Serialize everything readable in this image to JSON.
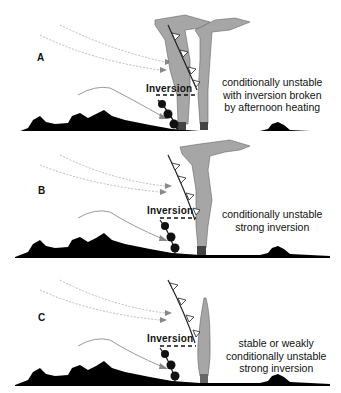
{
  "figure": {
    "panels": [
      {
        "letter": "A",
        "inversion_label": "Inversion",
        "caption_lines": [
          "conditionally unstable",
          "with inversion broken",
          "by afternoon heating"
        ],
        "plume": "two tall leaning plumes breaking through inversion"
      },
      {
        "letter": "B",
        "inversion_label": "Inversion",
        "caption_lines": [
          "conditionally unstable",
          "strong inversion"
        ],
        "plume": "single tall plume spreading horizontally at top"
      },
      {
        "letter": "C",
        "inversion_label": "Inversion",
        "caption_lines": [
          "stable or weakly",
          "conditionally unstable",
          "strong inversion"
        ],
        "plume": "narrow plume capped below inversion"
      }
    ],
    "colors": {
      "terrain": "#000000",
      "plume": "#a6a6a6",
      "wind_arrows": "#9a9a9a",
      "front": "#222222"
    }
  }
}
